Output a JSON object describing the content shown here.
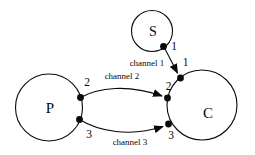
{
  "diagram": {
    "type": "process-channel-diagram",
    "background_color": "#ffffff",
    "line_color": "#0a0a0a",
    "nodes": [
      {
        "id": "P",
        "label": "P",
        "shape": "circle",
        "role": "left-node"
      },
      {
        "id": "S",
        "label": "S",
        "shape": "circle",
        "role": "top-node"
      },
      {
        "id": "C",
        "label": "C",
        "shape": "circle",
        "role": "right-node"
      }
    ],
    "ports": [
      {
        "node": "S",
        "label": "1"
      },
      {
        "node": "C",
        "label": "1"
      },
      {
        "node": "P",
        "label": "2"
      },
      {
        "node": "C",
        "label": "2"
      },
      {
        "node": "P",
        "label": "3"
      },
      {
        "node": "C",
        "label": "3"
      }
    ],
    "channels": [
      {
        "label": "channel 1",
        "from": "S port 1",
        "to": "C port 1"
      },
      {
        "label": "channel 2",
        "from": "P port 2",
        "to": "C port 2"
      },
      {
        "label": "channel 3",
        "from": "P port 3",
        "to": "C port 3"
      }
    ]
  }
}
